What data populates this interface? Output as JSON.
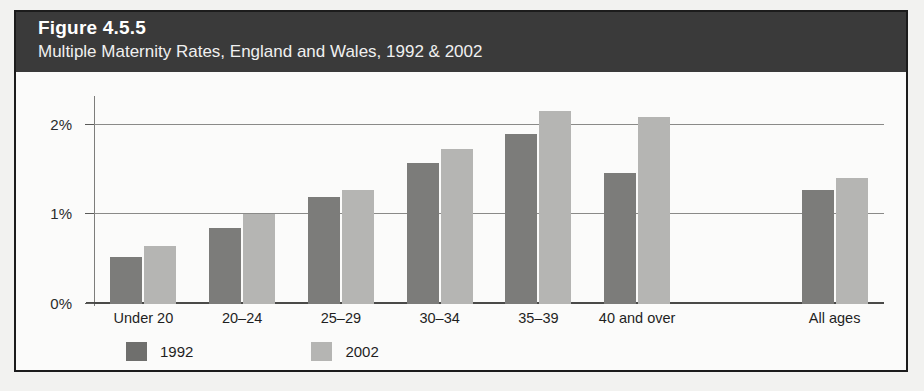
{
  "figure": {
    "number_label": "Figure 4.5.5",
    "caption": "Multiple Maternity Rates, England and Wales, 1992 & 2002"
  },
  "colors": {
    "header_band": "#3a3a3a",
    "series_1992": "#7c7c7a",
    "series_2002": "#b5b5b3",
    "card_border": "#1c1c1c",
    "gridline": "#8a8a88",
    "page_background": "#f2f2f0"
  },
  "chart_data": {
    "type": "bar",
    "title": "Figure 4.5.5",
    "subtitle": "Multiple Maternity Rates, England and Wales, 1992 & 2002",
    "xlabel": "",
    "ylabel": "",
    "categories": [
      "Under 20",
      "20–24",
      "25–29",
      "30–34",
      "35–39",
      "40 and over",
      "",
      "All ages"
    ],
    "series": [
      {
        "name": "1992",
        "color": "#7c7c7a",
        "values": [
          0.53,
          0.85,
          1.2,
          1.58,
          1.9,
          1.46,
          null,
          1.27
        ]
      },
      {
        "name": "2002",
        "color": "#b5b5b3",
        "values": [
          0.65,
          1.0,
          1.27,
          1.73,
          2.15,
          2.09,
          null,
          1.41
        ]
      }
    ],
    "ylim": [
      0,
      2.3
    ],
    "yticks": [
      0,
      1,
      2
    ],
    "ytick_labels": [
      "0%",
      "1%",
      "2%"
    ],
    "grid": true,
    "gridlines_at": [
      1,
      2
    ],
    "legend_position": "bottom-left",
    "legend_entries": [
      "1992",
      "2002"
    ],
    "value_unit": "percent"
  }
}
